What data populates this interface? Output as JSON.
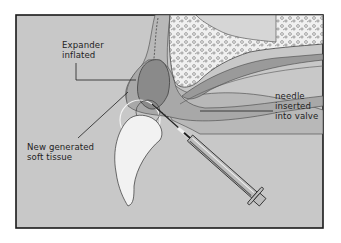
{
  "diagram": {
    "labels": {
      "expander": [
        "Expander",
        "inflated"
      ],
      "soft_tissue": [
        "New generated",
        "soft tissue"
      ],
      "needle": [
        "needle",
        "inserted",
        "into valve"
      ]
    },
    "colors": {
      "background": "#c8c8c8",
      "frame": "#1a1a1a",
      "bone": "#f0f0f0",
      "expander": "#8a8a8a",
      "soft_tissue_layer": "#a8a8a8",
      "syringe": "#b8b8b8",
      "line": "#1e1e1e"
    }
  }
}
